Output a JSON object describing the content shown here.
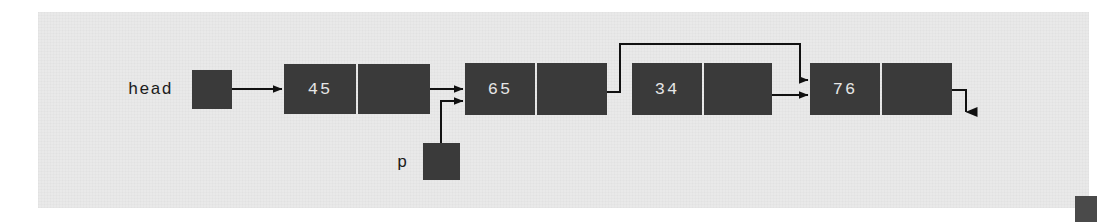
{
  "figure": {
    "kind": "linked-list-diagram",
    "background_color": "#e9e9e9",
    "box_color": "#3a3a3a",
    "line_color": "#111111",
    "text_color": "#e6e6e6"
  },
  "pointers": [
    {
      "name": "head",
      "label": "head",
      "target": "node-45"
    },
    {
      "name": "p",
      "label": "p",
      "target": "node-65"
    }
  ],
  "nodes": [
    {
      "id": "node-45",
      "value": "45",
      "next": "node-65"
    },
    {
      "id": "node-65",
      "value": "65",
      "next": "node-76"
    },
    {
      "id": "node-34",
      "value": "34",
      "next": "node-76"
    },
    {
      "id": "node-76",
      "value": "76",
      "next": "null"
    }
  ],
  "links": [
    {
      "name": "head-to-45",
      "from": "head",
      "to": "node-45",
      "style": "straight"
    },
    {
      "name": "45-to-65",
      "from": "node-45",
      "to": "node-65",
      "style": "straight"
    },
    {
      "name": "p-to-65",
      "from": "p",
      "to": "node-65",
      "style": "elbow-up"
    },
    {
      "name": "65-to-76",
      "from": "node-65",
      "to": "node-76",
      "style": "bypass-over-34"
    },
    {
      "name": "34-to-76",
      "from": "node-34",
      "to": "node-76",
      "style": "straight"
    },
    {
      "name": "76-to-null",
      "from": "node-76",
      "to": "null",
      "style": "elbow-down"
    }
  ]
}
